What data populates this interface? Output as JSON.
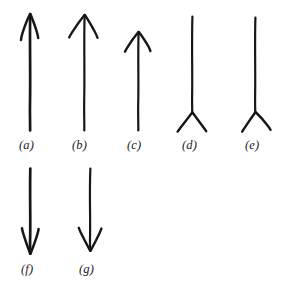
{
  "figure": {
    "background_color": "#ffffff",
    "ink_color": "#17161a",
    "width": 282,
    "height": 296,
    "label_style": "italic-serif-parenthesized",
    "rows": [
      {
        "name": "top-row",
        "label_y": 139,
        "items": [
          "a",
          "b",
          "c",
          "d",
          "e"
        ]
      },
      {
        "name": "bottom-row",
        "label_y": 263,
        "items": [
          "f",
          "g"
        ]
      }
    ]
  },
  "arrows": [
    {
      "id": "a",
      "label": "(a)",
      "label_x": 19,
      "label_y": 139,
      "direction": "up",
      "head": "arrowhead-narrow",
      "tail": "plain",
      "shaft_x": 30,
      "shaft_top": 14,
      "shaft_bottom": 130,
      "stroke_width": 2.6,
      "head_width": 18,
      "head_height": 26
    },
    {
      "id": "b",
      "label": "(b)",
      "label_x": 72,
      "label_y": 139,
      "direction": "up",
      "head": "arrowhead-wide",
      "tail": "plain",
      "shaft_x": 84,
      "shaft_top": 15,
      "shaft_bottom": 130,
      "stroke_width": 2.2,
      "head_width": 26,
      "head_height": 22
    },
    {
      "id": "c",
      "label": "(c)",
      "label_x": 127,
      "label_y": 139,
      "direction": "up",
      "head": "arrowhead-wide",
      "tail": "plain",
      "shaft_x": 138,
      "shaft_top": 32,
      "shaft_bottom": 130,
      "stroke_width": 2.2,
      "head_width": 26,
      "head_height": 20
    },
    {
      "id": "d",
      "label": "(d)",
      "label_x": 182,
      "label_y": 139,
      "direction": "up",
      "head": "none",
      "tail": "fletching-v-symmetric",
      "shaft_x": 192,
      "shaft_top": 16,
      "shaft_bottom": 113,
      "stroke_width": 2.2,
      "tail_width": 30,
      "tail_height": 22
    },
    {
      "id": "e",
      "label": "(e)",
      "label_x": 245,
      "label_y": 139,
      "direction": "up",
      "head": "none",
      "tail": "fletching-v-asymmetric",
      "shaft_x": 255,
      "shaft_top": 17,
      "shaft_bottom": 113,
      "stroke_width": 2.2,
      "tail_width": 30,
      "tail_height": 24
    },
    {
      "id": "f",
      "label": "(f)",
      "label_x": 21,
      "label_y": 263,
      "direction": "down",
      "head": "arrowhead-narrow",
      "tail": "plain",
      "shaft_x": 30,
      "shaft_top": 168,
      "shaft_bottom": 253,
      "stroke_width": 2.6,
      "head_width": 18,
      "head_height": 26
    },
    {
      "id": "g",
      "label": "(g)",
      "label_x": 79,
      "label_y": 263,
      "direction": "down",
      "head": "arrowhead-wide",
      "tail": "plain",
      "shaft_x": 90,
      "shaft_top": 168,
      "shaft_bottom": 250,
      "stroke_width": 2.2,
      "head_width": 24,
      "head_height": 24
    }
  ]
}
